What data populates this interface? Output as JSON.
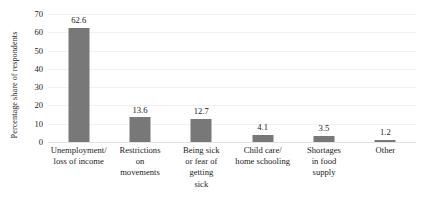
{
  "chart_data": {
    "type": "bar",
    "title": "",
    "subtitle": "",
    "xlabel": "",
    "ylabel": "Percentage share of respondents",
    "ylim": [
      0,
      70
    ],
    "yticks": [
      0,
      10,
      20,
      30,
      40,
      50,
      60,
      70
    ],
    "grid": true,
    "legend": false,
    "legend_position": "none",
    "bar_color": "#787878",
    "gridline_color": "#f1f1f1",
    "axis_color": "#e2e2e2",
    "categories": [
      "Unemployment/\nloss of income",
      "Restrictions\non\nmovements",
      "Being sick\nor fear of\ngetting\nsick",
      "Child care/\nhome schooling",
      "Shortages\nin food\nsupply",
      "Other"
    ],
    "category_lines": [
      [
        "Unemployment/",
        "loss of income"
      ],
      [
        "Restrictions",
        "on",
        "movements"
      ],
      [
        "Being sick",
        "or fear of",
        "getting",
        "sick"
      ],
      [
        "Child care/",
        "home schooling"
      ],
      [
        "Shortages",
        "in food",
        "supply"
      ],
      [
        "Other"
      ]
    ],
    "values": [
      62.6,
      13.6,
      12.7,
      4.1,
      3.5,
      1.2
    ],
    "value_labels": [
      "62.6",
      "13.6",
      "12.7",
      "4.1",
      "3.5",
      "1.2"
    ]
  }
}
